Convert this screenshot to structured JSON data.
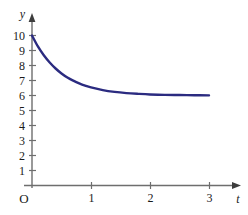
{
  "figure": {
    "background_color": "#ffffff",
    "axis_color": "#6e6e6e",
    "curve_color": "#2b2b80",
    "text_color": "#1a1a1a"
  },
  "labels": {
    "y_axis_name": "y",
    "x_axis_name": "t",
    "origin": "O"
  },
  "chart_data": {
    "type": "line",
    "title": "",
    "subtitle": "",
    "xlabel": "t",
    "ylabel": "y",
    "xlim": [
      0,
      3.3
    ],
    "ylim": [
      0,
      10.6
    ],
    "xticks": [
      1,
      2,
      3
    ],
    "xtick_labels": [
      "1",
      "2",
      "3"
    ],
    "yticks": [
      1,
      2,
      3,
      4,
      5,
      6,
      7,
      8,
      9,
      10
    ],
    "ytick_labels": [
      "1",
      "2",
      "3",
      "4",
      "5",
      "6",
      "7",
      "8",
      "9",
      "10"
    ],
    "grid": false,
    "legend": null,
    "legend_position": "none",
    "annotations": [],
    "asymptote": 6,
    "equation": "y = 6 + 4e^(-2t)",
    "series": [
      {
        "name": "y(t)",
        "color": "#2b2b80",
        "line_width": 2.4,
        "x": [
          0,
          0.1,
          0.2,
          0.3,
          0.4,
          0.5,
          0.6,
          0.7,
          0.8,
          0.9,
          1.0,
          1.2,
          1.4,
          1.6,
          1.8,
          2.0,
          2.25,
          2.5,
          2.75,
          3.0
        ],
        "values": [
          10.0,
          9.27,
          8.68,
          8.2,
          7.8,
          7.47,
          7.2,
          6.99,
          6.81,
          6.66,
          6.54,
          6.36,
          6.24,
          6.16,
          6.11,
          6.07,
          6.04,
          6.03,
          6.02,
          6.01
        ]
      }
    ]
  }
}
